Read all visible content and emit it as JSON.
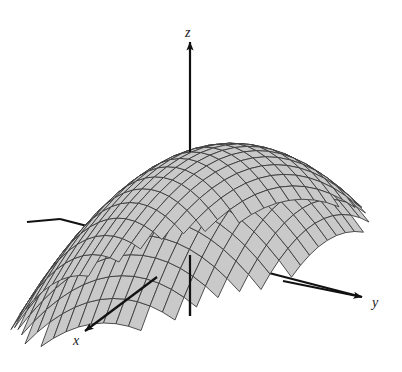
{
  "figure": {
    "title": "",
    "background_color": "#ffffff",
    "kind": "3d-surface-plot"
  },
  "axes": {
    "x": {
      "label": "x",
      "direction": "down-left (toward viewer)",
      "label_x": 73,
      "label_y": 345,
      "arrow_tip_x": 85,
      "arrow_tip_y": 331,
      "start_x": 330,
      "start_y": 196
    },
    "y": {
      "label": "y",
      "direction": "right",
      "label_x": 372,
      "label_y": 307,
      "arrow_tip_x": 362,
      "arrow_tip_y": 297,
      "start_x": 60,
      "start_y": 219
    },
    "z": {
      "label": "z",
      "direction": "up",
      "label_x": 185,
      "label_y": 37,
      "arrow_tip_x": 190,
      "arrow_tip_y": 42,
      "start_x": 190,
      "start_y": 316
    },
    "line_color": "#111111",
    "line_width": 2.2,
    "arrow_size": 9
  },
  "surface": {
    "fill_color": "#c9c9c9",
    "mesh_color": "#3c3c3c",
    "silhouette_color": "#1f1f1f",
    "mesh_line_width": 0.9,
    "grid_u_divisions": 24,
    "grid_v_divisions": 24,
    "shape": "paraboloid",
    "equation": "z = 1 - (x^2 + y^2)",
    "domain_half_width": 1.0,
    "clip_z": 0.0,
    "scalloped_bottom_edge": true
  },
  "projection": {
    "origin_x": 190,
    "origin_y": 283,
    "scale_x": 150,
    "scale_y": 150,
    "scale_z": 130,
    "elevation_factor": 0.42,
    "x_axis_screen_dx": -0.72,
    "x_axis_screen_dy": 0.45,
    "y_axis_screen_dx": 1.0,
    "y_axis_screen_dy": 0.16
  },
  "chart_data": {
    "type": "surface",
    "title": "",
    "xlabel": "x",
    "ylabel": "y",
    "zlabel": "z",
    "function": "z = 1 - x^2 - y^2",
    "xlim": [
      -1,
      1
    ],
    "ylim": [
      -1,
      1
    ],
    "zlim": [
      0,
      1
    ],
    "grid": true,
    "legend": "none",
    "mesh_rows": 24,
    "mesh_cols": 24
  }
}
